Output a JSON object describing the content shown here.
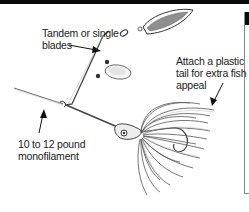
{
  "diagram": {
    "callouts": [
      {
        "id": "blades",
        "lines": [
          "Tandem or single",
          "blades"
        ]
      },
      {
        "id": "tail",
        "lines": [
          "Attach a plastic",
          "tail for extra fish",
          "appeal"
        ]
      },
      {
        "id": "line",
        "lines": [
          "10 to 12 pound",
          "monofilament"
        ]
      }
    ]
  },
  "colors": {
    "ink": "#1a1a1a",
    "frame": "#0a0a0a",
    "blade_fill": "#9a9a9a",
    "skirt_stroke": "#555555"
  }
}
